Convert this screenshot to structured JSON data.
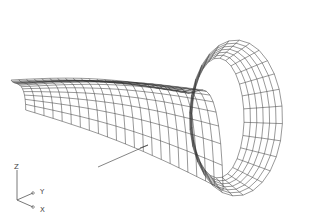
{
  "drawing": {
    "type": "3D wireframe mesh",
    "description": "Swept surface: arched trough transitioning into a flared bell/flange",
    "line_color": "#333333",
    "background": "#ffffff"
  },
  "ucs_icon": {
    "axes": [
      {
        "label": "Z"
      },
      {
        "label": "Y"
      },
      {
        "label": "X"
      }
    ]
  }
}
